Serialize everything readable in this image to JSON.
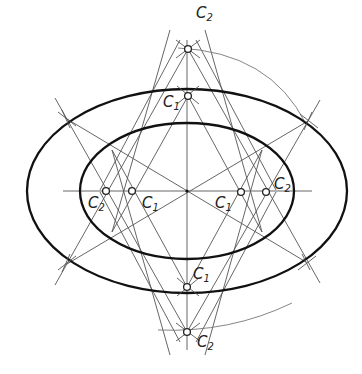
{
  "diagram": {
    "center": [
      187,
      191
    ],
    "axes": {
      "horizontal": {
        "x1": 63,
        "x2": 312,
        "y": 191
      },
      "vertical": {
        "x": 187,
        "y1": 40,
        "y2": 350
      }
    },
    "ellipses": [
      {
        "name": "outer",
        "cx": 187,
        "cy": 191,
        "rx": 160,
        "ry": 102
      },
      {
        "name": "inner",
        "cx": 187,
        "cy": 191,
        "rx": 107,
        "ry": 68
      }
    ],
    "centers": [
      {
        "id": "c2-top",
        "label": "C",
        "sub": "2",
        "x": 188,
        "y": 49,
        "lx": 196,
        "ly": 18
      },
      {
        "id": "c1-top",
        "label": "C",
        "sub": "1",
        "x": 188,
        "y": 96,
        "lx": 163,
        "ly": 107
      },
      {
        "id": "c2-left",
        "label": "C",
        "sub": "2",
        "x": 106,
        "y": 191,
        "lx": 88,
        "ly": 208
      },
      {
        "id": "c1-left",
        "label": "C",
        "sub": "1",
        "x": 132,
        "y": 191,
        "lx": 142,
        "ly": 208
      },
      {
        "id": "c1-right",
        "label": "C",
        "sub": "1",
        "x": 241,
        "y": 192,
        "lx": 215,
        "ly": 208
      },
      {
        "id": "c2-right",
        "label": "C",
        "sub": "2",
        "x": 266,
        "y": 192,
        "lx": 274,
        "ly": 189
      },
      {
        "id": "c1-bottom",
        "label": "C",
        "sub": "1",
        "x": 187,
        "y": 287,
        "lx": 193,
        "ly": 279
      },
      {
        "id": "c2-bottom",
        "label": "C",
        "sub": "2",
        "x": 187,
        "y": 332,
        "lx": 197,
        "ly": 347
      }
    ],
    "tangent_points_outer": [
      [
        67,
        119
      ],
      [
        308,
        121
      ],
      [
        67,
        264
      ],
      [
        306,
        262
      ]
    ],
    "tangent_points_inner": [
      [
        108,
        146
      ],
      [
        268,
        146
      ],
      [
        106,
        238
      ],
      [
        268,
        237
      ]
    ],
    "construction_lines": [
      [
        67,
        119,
        306,
        262
      ],
      [
        308,
        121,
        67,
        264
      ],
      [
        188,
        49,
        55,
        285
      ],
      [
        188,
        49,
        320,
        283
      ],
      [
        187,
        332,
        55,
        98
      ],
      [
        187,
        332,
        320,
        100
      ],
      [
        188,
        96,
        112,
        232
      ],
      [
        188,
        96,
        262,
        232
      ],
      [
        187,
        287,
        112,
        150
      ],
      [
        187,
        287,
        262,
        150
      ],
      [
        180,
        40,
        100,
        190
      ],
      [
        196,
        40,
        276,
        190
      ],
      [
        180,
        342,
        100,
        192
      ],
      [
        196,
        342,
        276,
        192
      ],
      [
        112,
        150,
        170,
        355
      ],
      [
        262,
        150,
        205,
        355
      ],
      [
        112,
        232,
        170,
        30
      ],
      [
        262,
        232,
        205,
        30
      ]
    ],
    "arcs": [
      {
        "name": "top-c2-arc",
        "d": "M 178 48 Q 270 52 306 124"
      },
      {
        "name": "bottom-c2-arc",
        "d": "M 158 330 Q 230 333 292 303"
      }
    ],
    "tick_marks": [
      [
        58,
        112,
        76,
        126
      ],
      [
        62,
        110,
        70,
        128
      ],
      [
        300,
        114,
        318,
        128
      ],
      [
        312,
        112,
        304,
        130
      ],
      [
        58,
        270,
        76,
        256
      ],
      [
        62,
        272,
        70,
        254
      ],
      [
        298,
        270,
        316,
        256
      ],
      [
        310,
        270,
        302,
        254
      ],
      [
        176,
        40,
        200,
        58
      ],
      [
        200,
        40,
        176,
        58
      ],
      [
        176,
        323,
        200,
        341
      ],
      [
        200,
        323,
        176,
        341
      ],
      [
        177,
        86,
        199,
        104
      ],
      [
        199,
        86,
        177,
        104
      ],
      [
        177,
        278,
        199,
        296
      ],
      [
        199,
        278,
        177,
        296
      ]
    ]
  }
}
